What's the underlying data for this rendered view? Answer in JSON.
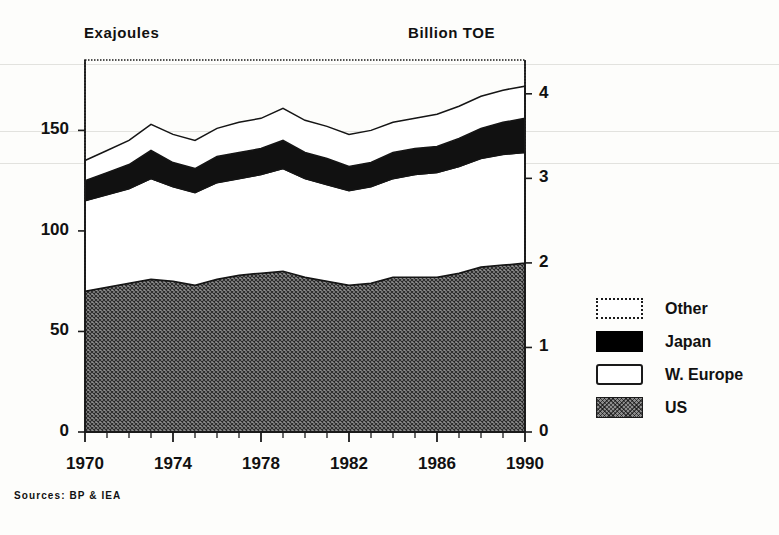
{
  "axis_titles": {
    "left": "Exajoules",
    "right": "Billion TOE"
  },
  "source_note": "Sources: BP & IEA",
  "legend": {
    "items": [
      {
        "label": "Other",
        "swatch": "dotted-outline-white",
        "color": "#ffffff"
      },
      {
        "label": "Japan",
        "swatch": "solid-black",
        "color": "#000000"
      },
      {
        "label": "W. Europe",
        "swatch": "solid-outline-white",
        "color": "#ffffff"
      },
      {
        "label": "US",
        "swatch": "cross-hatch-gray",
        "color": "#8d8d8d"
      }
    ]
  },
  "chart_data": {
    "type": "area",
    "title": "",
    "subtitle": "",
    "xlabel": "",
    "ylabel": "Exajoules",
    "y2label": "Billion TOE",
    "stacked": true,
    "grid": false,
    "legend_position": "right",
    "xlim": [
      1970,
      1990
    ],
    "ylim": [
      0,
      185
    ],
    "y2lim": [
      0,
      4.4
    ],
    "yticks": [
      0,
      50,
      100,
      150
    ],
    "ytick_labels": [
      "0",
      "50",
      "100",
      "150"
    ],
    "y2ticks": [
      0,
      1,
      2,
      3,
      4
    ],
    "y2tick_labels": [
      "0",
      "1",
      "2",
      "3",
      "4"
    ],
    "xticks": [
      1970,
      1974,
      1978,
      1982,
      1986,
      1990
    ],
    "xtick_labels": [
      "1970",
      "1974",
      "1978",
      "1982",
      "1986",
      "1990"
    ],
    "minor_xticks_every": 1,
    "x": [
      1970,
      1971,
      1972,
      1973,
      1974,
      1975,
      1976,
      1977,
      1978,
      1979,
      1980,
      1981,
      1982,
      1983,
      1984,
      1985,
      1986,
      1987,
      1988,
      1989,
      1990
    ],
    "series": [
      {
        "name": "US",
        "values": [
          70,
          72,
          74,
          76,
          75,
          73,
          76,
          78,
          79,
          80,
          77,
          75,
          73,
          74,
          77,
          77,
          77,
          79,
          82,
          83,
          84
        ]
      },
      {
        "name": "W. Europe",
        "values": [
          45,
          46,
          47,
          50,
          47,
          46,
          48,
          48,
          49,
          51,
          49,
          48,
          47,
          48,
          49,
          51,
          52,
          53,
          54,
          55,
          55
        ]
      },
      {
        "name": "Japan",
        "values": [
          10,
          11,
          12,
          14,
          12,
          12,
          13,
          13,
          13,
          14,
          13,
          13,
          12,
          12,
          13,
          13,
          13,
          14,
          15,
          16,
          17
        ]
      },
      {
        "name": "Other",
        "values": [
          10,
          11,
          12,
          13,
          14,
          14,
          14,
          15,
          15,
          16,
          16,
          16,
          16,
          16,
          15,
          15,
          16,
          16,
          16,
          16,
          16
        ]
      }
    ],
    "totals": [
      135,
      140,
      145,
      153,
      148,
      145,
      151,
      154,
      156,
      161,
      155,
      152,
      148,
      150,
      154,
      156,
      158,
      162,
      167,
      170,
      172
    ]
  }
}
